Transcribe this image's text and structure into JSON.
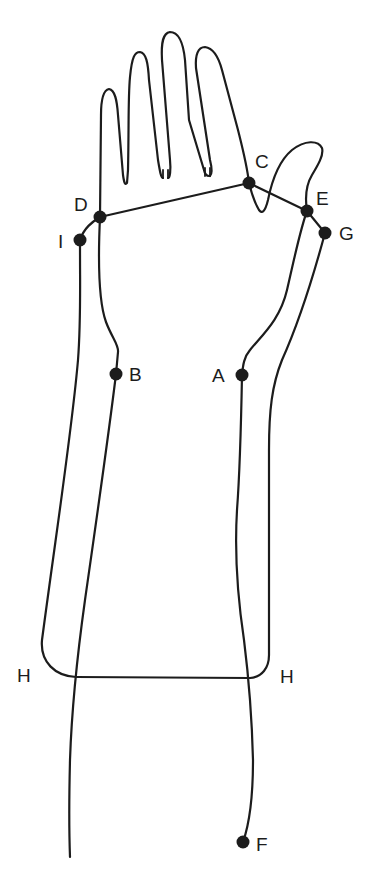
{
  "diagram": {
    "colors": {
      "ink": "#1c1c1c",
      "background": "#ffffff"
    },
    "points": [
      {
        "id": "C",
        "label": "C",
        "x": 249,
        "y": 183
      },
      {
        "id": "D",
        "label": "D",
        "x": 100,
        "y": 217
      },
      {
        "id": "E",
        "label": "E",
        "x": 307,
        "y": 211
      },
      {
        "id": "G",
        "label": "G",
        "x": 325,
        "y": 233
      },
      {
        "id": "I",
        "label": "I",
        "x": 80,
        "y": 240
      },
      {
        "id": "B",
        "label": "B",
        "x": 116,
        "y": 374
      },
      {
        "id": "A",
        "label": "A",
        "x": 242,
        "y": 375
      },
      {
        "id": "F",
        "label": "F",
        "x": 243,
        "y": 842
      }
    ],
    "labels": {
      "C": "C",
      "D": "D",
      "E": "E",
      "G": "G",
      "I": "I",
      "B": "B",
      "A": "A",
      "F": "F",
      "H_left": "H",
      "H_right": "H"
    },
    "segments": [
      {
        "from": "D",
        "to": "C"
      },
      {
        "from": "C",
        "to": "E"
      },
      {
        "from": "E",
        "to": "G"
      },
      {
        "from": "D",
        "to": "I"
      }
    ]
  }
}
